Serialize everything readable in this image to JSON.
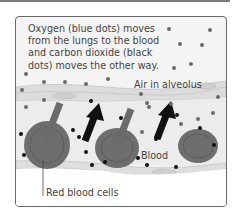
{
  "diagram": {
    "caption_lines": [
      "Oxygen (blue dots) moves",
      "from the lungs to the blood",
      "and carbon dioxide (black",
      "dots) moves the other way."
    ],
    "labels": {
      "air": "Air in alveolus",
      "blood": "Blood",
      "red_blood_cells": "Red blood cells"
    },
    "colors": {
      "oxygen_dot": "#6b6b6b",
      "co2_dot": "#111111",
      "oxygen_arrow": "#6b6b6b",
      "co2_arrow": "#111111",
      "red_blood_cell": "#6e6e6e",
      "alveolus_bg": "#f4f4f4",
      "capillary_wall": "#d8d8d8"
    },
    "legend": [
      {
        "symbol": "blue dots",
        "meaning": "Oxygen"
      },
      {
        "symbol": "black dots",
        "meaning": "Carbon dioxide"
      }
    ],
    "flows": [
      {
        "substance": "Oxygen",
        "direction": "lungs to blood",
        "arrow_count": 2
      },
      {
        "substance": "Carbon dioxide",
        "direction": "blood to lungs",
        "arrow_count": 2
      }
    ],
    "red_blood_cell_count": 3
  }
}
